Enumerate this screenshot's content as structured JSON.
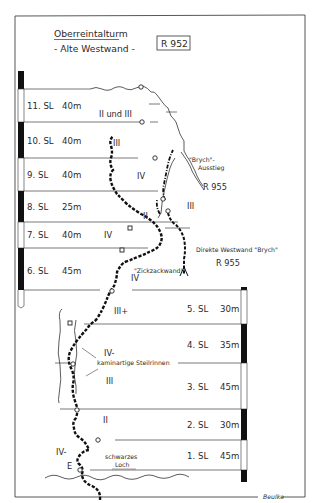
{
  "header": {
    "title": "Oberreintalturm",
    "subtitle": "- Alte Westwand -",
    "route_number": "R 952"
  },
  "left_pitches": [
    {
      "label": "11. SL",
      "length": "40m",
      "y1": 89,
      "y2": 122,
      "bar": "white"
    },
    {
      "label": "10. SL",
      "length": "40m",
      "y1": 122,
      "y2": 158,
      "bar": "black"
    },
    {
      "label": "9. SL",
      "length": "40m",
      "y1": 158,
      "y2": 191,
      "bar": "white"
    },
    {
      "label": "8. SL",
      "length": "25m",
      "y1": 191,
      "y2": 222,
      "bar": "black"
    },
    {
      "label": "7. SL",
      "length": "40m",
      "y1": 222,
      "y2": 248,
      "bar": "white"
    },
    {
      "label": "6. SL",
      "length": "45m",
      "y1": 248,
      "y2": 290,
      "bar": "black"
    }
  ],
  "right_pitches": [
    {
      "label": "5. SL",
      "length": "30m",
      "y1": 290,
      "y2": 324,
      "bar": "white"
    },
    {
      "label": "4. SL",
      "length": "35m",
      "y1": 324,
      "y2": 363,
      "bar": "black"
    },
    {
      "label": "3. SL",
      "length": "45m",
      "y1": 363,
      "y2": 409,
      "bar": "white"
    },
    {
      "label": "2. SL",
      "length": "30m",
      "y1": 409,
      "y2": 440,
      "bar": "black"
    },
    {
      "label": "1. SL",
      "length": "45m",
      "y1": 440,
      "y2": 470,
      "bar": "white"
    }
  ],
  "grades": [
    {
      "text": "II und III",
      "x": 99,
      "y": 117
    },
    {
      "text": "III",
      "x": 113,
      "y": 146
    },
    {
      "text": "IV",
      "x": 137,
      "y": 179
    },
    {
      "text": "III",
      "x": 187,
      "y": 209
    },
    {
      "text": "II",
      "x": 143,
      "y": 219
    },
    {
      "text": "IV",
      "x": 104,
      "y": 238
    },
    {
      "text": "IV",
      "x": 131,
      "y": 281
    },
    {
      "text": "III+",
      "x": 114,
      "y": 314
    },
    {
      "text": "IV-",
      "x": 104,
      "y": 356
    },
    {
      "text": "III",
      "x": 106,
      "y": 384
    },
    {
      "text": "II",
      "x": 103,
      "y": 423
    },
    {
      "text": "IV-",
      "x": 56,
      "y": 455
    }
  ],
  "annotations": {
    "brych_exit_line1": "\"Brych\"-",
    "brych_exit_line2": "Ausstieg",
    "brych_exit_route": "R 955",
    "direct_route": "Direkte Westwand \"Brych\"",
    "direct_route_number": "R 955",
    "zigzag": "\"Zickzackwand!\"",
    "chimney": "kaminartige Steilrinnen",
    "black_hole_line1": "schwarzes",
    "black_hole_line2": "Loch",
    "start": "E",
    "signature": "Beulke"
  },
  "colors": {
    "ink": "#2a2a2a",
    "bar_black": "#111111",
    "background": "#ffffff"
  }
}
